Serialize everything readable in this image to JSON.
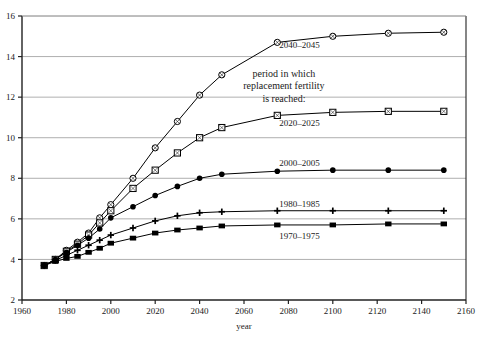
{
  "chart_data": {
    "type": "line",
    "title": "",
    "subtitle": "",
    "xlabel": "year",
    "ylabel": "",
    "xlim": [
      1960,
      2160
    ],
    "ylim": [
      2,
      16
    ],
    "xticks": [
      1960,
      1980,
      2000,
      2020,
      2040,
      2060,
      2080,
      2100,
      2120,
      2140,
      2160
    ],
    "yticks": [
      2,
      4,
      6,
      8,
      10,
      12,
      14,
      16
    ],
    "xtick_labels": [
      "1960",
      "1980",
      "2000",
      "2020",
      "2040",
      "2060",
      "2080",
      "2100",
      "2120",
      "2140",
      "2160"
    ],
    "ytick_labels": [
      "2",
      "4",
      "6",
      "8",
      "10",
      "12",
      "14",
      "16"
    ],
    "grid": "horizontal",
    "legend_position": "inline-right",
    "legend_note": [
      "period in which",
      "replacement fertility",
      "is reached:"
    ],
    "series": [
      {
        "name": "2040–2045",
        "marker": "circle-open",
        "label_x": 2085,
        "label_y": 14.55,
        "x": [
          1970,
          1975,
          1980,
          1985,
          1990,
          1995,
          2000,
          2010,
          2020,
          2030,
          2040,
          2050,
          2075,
          2100,
          2125,
          2150
        ],
        "y": [
          3.7,
          4.0,
          4.45,
          4.85,
          5.3,
          6.05,
          6.7,
          8.0,
          9.5,
          10.8,
          12.1,
          13.1,
          14.7,
          15.0,
          15.15,
          15.2
        ]
      },
      {
        "name": "2020–2025",
        "marker": "square-open",
        "label_x": 2085,
        "label_y": 10.75,
        "x": [
          1970,
          1975,
          1980,
          1985,
          1990,
          1995,
          2000,
          2010,
          2020,
          2030,
          2040,
          2050,
          2075,
          2100,
          2125,
          2150
        ],
        "y": [
          3.7,
          4.0,
          4.4,
          4.75,
          5.2,
          5.8,
          6.4,
          7.5,
          8.4,
          9.25,
          10.0,
          10.5,
          11.1,
          11.25,
          11.3,
          11.3
        ]
      },
      {
        "name": "2000–2005",
        "marker": "circle-filled",
        "label_x": 2085,
        "label_y": 8.75,
        "x": [
          1970,
          1975,
          1980,
          1985,
          1990,
          1995,
          2000,
          2010,
          2020,
          2030,
          2040,
          2050,
          2075,
          2100,
          2125,
          2150
        ],
        "y": [
          3.7,
          4.0,
          4.35,
          4.7,
          5.05,
          5.5,
          6.05,
          6.6,
          7.15,
          7.6,
          8.0,
          8.2,
          8.35,
          8.4,
          8.4,
          8.4
        ]
      },
      {
        "name": "1980–1985",
        "marker": "plus",
        "label_x": 2085,
        "label_y": 6.75,
        "x": [
          1970,
          1975,
          1980,
          1985,
          1990,
          1995,
          2000,
          2010,
          2020,
          2030,
          2040,
          2050,
          2075,
          2100,
          2125,
          2150
        ],
        "y": [
          3.7,
          3.95,
          4.2,
          4.45,
          4.7,
          4.95,
          5.2,
          5.55,
          5.9,
          6.15,
          6.3,
          6.35,
          6.4,
          6.4,
          6.4,
          6.4
        ]
      },
      {
        "name": "1970–1975",
        "marker": "square-filled",
        "label_x": 2085,
        "label_y": 5.15,
        "x": [
          1970,
          1975,
          1980,
          1985,
          1990,
          1995,
          2000,
          2010,
          2020,
          2030,
          2040,
          2050,
          2075,
          2100,
          2125,
          2150
        ],
        "y": [
          3.7,
          3.9,
          4.05,
          4.15,
          4.35,
          4.55,
          4.8,
          5.05,
          5.3,
          5.45,
          5.55,
          5.65,
          5.7,
          5.7,
          5.75,
          5.75
        ]
      }
    ],
    "colors": {
      "line": "#000000",
      "grid": "#9a9a9a",
      "axis": "#222222",
      "text": "#1a1a1a",
      "background": "#ffffff"
    }
  }
}
